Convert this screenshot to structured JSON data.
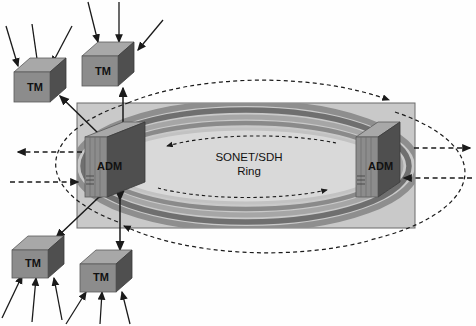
{
  "diagram": {
    "ring_label_line1": "SONET/SDH",
    "ring_label_line2": "Ring",
    "colors": {
      "cloud_fill": "#c9c9c9",
      "ring_inner_fill": "#d8d8d8",
      "band_dark": "#7d7d7d",
      "band_mid": "#a2a2a2",
      "band_light": "#bdbdbd",
      "box_front": "#8a8a8a",
      "box_top": "#a8a8a8",
      "box_side": "#555555",
      "line": "#1a1a1a",
      "outline": "#6a6a6a"
    }
  },
  "nodes": {
    "adm_left": {
      "label": "ADM",
      "x": 78,
      "y": 135
    },
    "adm_right": {
      "label": "ADM",
      "x": 352,
      "y": 135
    },
    "tm_top_left": {
      "label": "TM",
      "x": 14,
      "y": 58
    },
    "tm_top_mid": {
      "label": "TM",
      "x": 82,
      "y": 34
    },
    "tm_bottom_left": {
      "label": "TM",
      "x": 10,
      "y": 236
    },
    "tm_bottom_mid": {
      "label": "TM",
      "x": 78,
      "y": 252
    }
  },
  "labels": {
    "adm_left_text": "ADM",
    "adm_right_text": "ADM",
    "tm_top_left_text": "TM",
    "tm_top_mid_text": "TM",
    "tm_bottom_left_text": "TM",
    "tm_bottom_mid_text": "TM"
  }
}
